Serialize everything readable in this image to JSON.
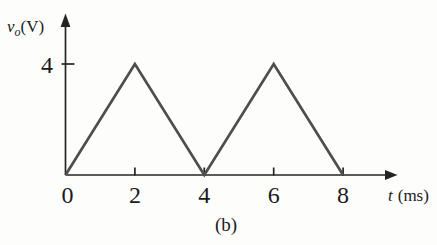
{
  "figure": {
    "caption": "(b)",
    "background": "#fdfdfc"
  },
  "chart_data": {
    "type": "line",
    "title": "",
    "xlabel": "t (ms)",
    "ylabel": "vo(V)",
    "xlabel_parts": {
      "symbol": "t",
      "unit": "(ms)"
    },
    "ylabel_parts": {
      "symbol": "v",
      "subscript": "o",
      "unit": "(V)"
    },
    "series": [
      {
        "name": "vo",
        "x": [
          0,
          2,
          4,
          6,
          8
        ],
        "y": [
          0,
          4,
          0,
          4,
          0
        ]
      }
    ],
    "waveform_shape": "triangular",
    "period_ms": 4,
    "amplitude_V": 4,
    "xticks": [
      {
        "value": 0,
        "label": "0"
      },
      {
        "value": 2,
        "label": "2"
      },
      {
        "value": 4,
        "label": "4"
      },
      {
        "value": 6,
        "label": "6"
      },
      {
        "value": 8,
        "label": "8"
      }
    ],
    "yticks": [
      {
        "value": 4,
        "label": "4"
      }
    ],
    "xlim": [
      0,
      9.6
    ],
    "ylim": [
      0,
      5.8
    ],
    "grid": false,
    "legend": false,
    "line_color": "#4e4e4e",
    "axis_color": "#242424",
    "text_color": "#1b1b1b"
  }
}
